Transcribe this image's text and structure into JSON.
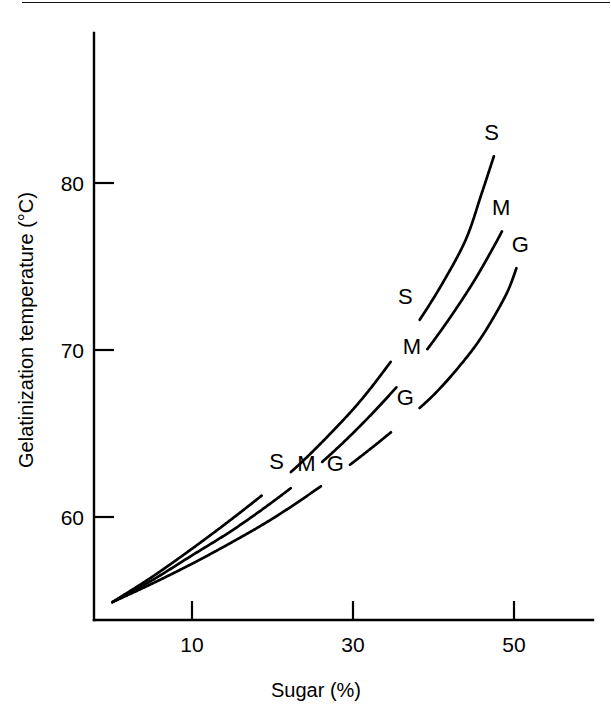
{
  "figure": {
    "background_color": "#ffffff",
    "ink_color": "#000000",
    "page_rule": "horizontal-rule-top"
  },
  "chart_data": {
    "type": "line",
    "title": "",
    "xlabel": "Sugar (%)",
    "ylabel": "Gelatinization temperature (°C)",
    "xlim": [
      0,
      62
    ],
    "ylim": [
      54,
      89
    ],
    "xticks": [
      10,
      30,
      50
    ],
    "xtick_labels": [
      "10",
      "30",
      "50"
    ],
    "yticks": [
      60,
      70,
      80
    ],
    "ytick_labels": [
      "60",
      "70",
      "80"
    ],
    "grid": false,
    "legend": "inline-curve-labels",
    "series": [
      {
        "name": "S",
        "label": "S",
        "description": "sucrose",
        "x": [
          0.1,
          5,
          10,
          15,
          20,
          23,
          27,
          31,
          35,
          38,
          41,
          44,
          46,
          47.5
        ],
        "y": [
          54.9,
          56.4,
          58.1,
          59.9,
          61.8,
          63.0,
          64.9,
          67.0,
          69.5,
          71.6,
          73.9,
          76.6,
          79.4,
          81.6
        ]
      },
      {
        "name": "M",
        "label": "M",
        "description": "maltose",
        "x": [
          0.1,
          5,
          10,
          15,
          20,
          24,
          28,
          32,
          36,
          39,
          42,
          45,
          47.5,
          48.5
        ],
        "y": [
          54.9,
          56.2,
          57.7,
          59.2,
          60.9,
          62.4,
          64.1,
          66.0,
          68.1,
          69.9,
          71.9,
          74.1,
          76.2,
          77.1
        ]
      },
      {
        "name": "G",
        "label": "G",
        "description": "glucose",
        "x": [
          0.1,
          5,
          10,
          15,
          20,
          25,
          29,
          33,
          37,
          40,
          43,
          46,
          49,
          50.3
        ],
        "y": [
          54.9,
          56.0,
          57.2,
          58.5,
          59.9,
          61.5,
          62.9,
          64.4,
          66.0,
          67.3,
          68.9,
          70.8,
          73.3,
          74.9
        ]
      }
    ],
    "annotations": [
      {
        "text": "S",
        "x": 20.5,
        "y": 63.3,
        "role": "inline-curve-label-lower"
      },
      {
        "text": "M",
        "x": 24.2,
        "y": 63.2,
        "role": "inline-curve-label-lower"
      },
      {
        "text": "G",
        "x": 27.8,
        "y": 63.2,
        "role": "inline-curve-label-lower"
      },
      {
        "text": "S",
        "x": 36.5,
        "y": 73.2,
        "role": "inline-curve-label-middle"
      },
      {
        "text": "M",
        "x": 37.3,
        "y": 70.2,
        "role": "inline-curve-label-middle"
      },
      {
        "text": "G",
        "x": 36.5,
        "y": 67.1,
        "role": "inline-curve-label-middle"
      },
      {
        "text": "S",
        "x": 47.2,
        "y": 83.0,
        "role": "curve-end-label"
      },
      {
        "text": "M",
        "x": 48.4,
        "y": 78.5,
        "role": "curve-end-label"
      },
      {
        "text": "G",
        "x": 50.8,
        "y": 76.3,
        "role": "curve-end-label"
      }
    ]
  }
}
